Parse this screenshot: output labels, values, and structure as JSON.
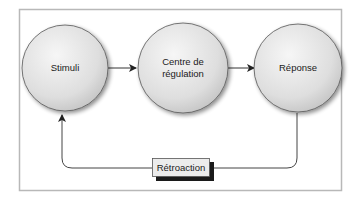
{
  "diagram": {
    "type": "feedback-loop",
    "nodes": [
      {
        "id": "stimuli",
        "label_lines": [
          "Stimuli"
        ]
      },
      {
        "id": "centre",
        "label_lines": [
          "Centre de",
          "régulation"
        ]
      },
      {
        "id": "reponse",
        "label_lines": [
          "Réponse"
        ]
      }
    ],
    "feedback": {
      "label": "Rétroaction"
    },
    "edges": [
      {
        "from": "stimuli",
        "to": "centre"
      },
      {
        "from": "centre",
        "to": "reponse"
      },
      {
        "from": "reponse",
        "to": "stimuli",
        "via": "Rétroaction"
      }
    ],
    "colors": {
      "frame": "#b8b8b8",
      "circle_fill_light": "#f2f2f2",
      "circle_fill_dark": "#c8c8c8",
      "circle_stroke": "#555555",
      "arrow": "#222222",
      "box_fill": "#ececec",
      "box_shadow": "#1a1a1a"
    }
  }
}
